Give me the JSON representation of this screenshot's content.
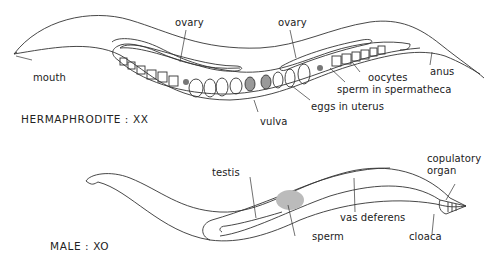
{
  "diagram": {
    "hermaphrodite": {
      "title": "HERMAPHRODITE : XX",
      "labels": {
        "ovary_left": "ovary",
        "ovary_right": "ovary",
        "mouth": "mouth",
        "oocytes": "oocytes",
        "anus": "anus",
        "sperm_in_spermatheca": "sperm in spermatheca",
        "eggs_in_uterus": "eggs in uterus",
        "vulva": "vulva"
      }
    },
    "male": {
      "title": "MALE : XO",
      "labels": {
        "testis": "testis",
        "copulatory_organ_line1": "copulatory",
        "copulatory_organ_line2": "organ",
        "vas_deferens": "vas deferens",
        "sperm": "sperm",
        "cloaca": "cloaca"
      }
    },
    "colors": {
      "line": "#333333",
      "background": "#ffffff"
    }
  }
}
